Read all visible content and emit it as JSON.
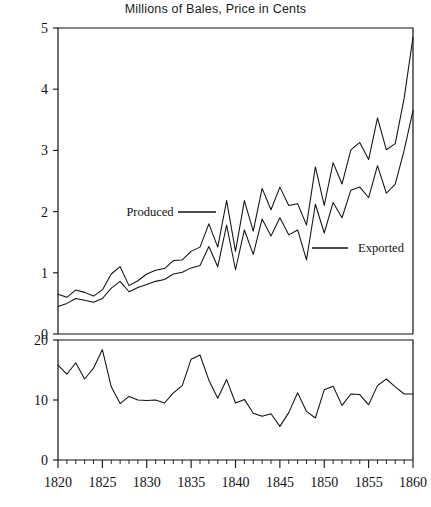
{
  "chart_data": {
    "type": "line",
    "title": "Millions of Bales, Price in Cents",
    "xlabel": "",
    "ylabel": "",
    "grid": false,
    "legend_position": "inline-annotation",
    "panels": [
      {
        "name": "upper",
        "ylabel": "Millions of Bales",
        "ylim": [
          0,
          5
        ],
        "yticks": [
          0,
          1,
          2,
          3,
          4,
          5
        ],
        "xlim": [
          1820,
          1860
        ],
        "series": [
          {
            "name": "Produced",
            "annotation": "Produced",
            "x": [
              1820,
              1821,
              1822,
              1823,
              1824,
              1825,
              1826,
              1827,
              1828,
              1829,
              1830,
              1831,
              1832,
              1833,
              1834,
              1835,
              1836,
              1837,
              1838,
              1839,
              1840,
              1841,
              1842,
              1843,
              1844,
              1845,
              1846,
              1847,
              1848,
              1849,
              1850,
              1851,
              1852,
              1853,
              1854,
              1855,
              1856,
              1857,
              1858,
              1859,
              1860
            ],
            "values": [
              0.65,
              0.6,
              0.72,
              0.68,
              0.62,
              0.72,
              0.98,
              1.1,
              0.79,
              0.87,
              0.98,
              1.04,
              1.07,
              1.2,
              1.21,
              1.35,
              1.42,
              1.8,
              1.42,
              2.18,
              1.35,
              2.18,
              1.68,
              2.38,
              2.03,
              2.4,
              2.1,
              2.13,
              1.78,
              2.73,
              2.1,
              2.8,
              2.45,
              3.01,
              3.13,
              2.85,
              3.53,
              3.01,
              3.11,
              3.85,
              4.85
            ],
            "units": "millions of bales"
          },
          {
            "name": "Exported",
            "annotation": "Exported",
            "x": [
              1820,
              1821,
              1822,
              1823,
              1824,
              1825,
              1826,
              1827,
              1828,
              1829,
              1830,
              1831,
              1832,
              1833,
              1834,
              1835,
              1836,
              1837,
              1838,
              1839,
              1840,
              1841,
              1842,
              1843,
              1844,
              1845,
              1846,
              1847,
              1848,
              1849,
              1850,
              1851,
              1852,
              1853,
              1854,
              1855,
              1856,
              1857,
              1858,
              1859,
              1860
            ],
            "values": [
              0.45,
              0.5,
              0.58,
              0.55,
              0.52,
              0.58,
              0.75,
              0.86,
              0.69,
              0.76,
              0.81,
              0.86,
              0.89,
              0.98,
              1.01,
              1.08,
              1.12,
              1.43,
              1.1,
              1.78,
              1.05,
              1.7,
              1.3,
              1.88,
              1.6,
              1.9,
              1.62,
              1.7,
              1.21,
              2.12,
              1.65,
              2.15,
              1.9,
              2.35,
              2.4,
              2.23,
              2.75,
              2.3,
              2.45,
              3.0,
              3.65
            ],
            "units": "millions of bales"
          }
        ]
      },
      {
        "name": "lower",
        "ylabel": "Price in Cents",
        "ylim": [
          0,
          20
        ],
        "yticks": [
          0,
          10,
          20
        ],
        "xlim": [
          1820,
          1860
        ],
        "series": [
          {
            "name": "Price",
            "x": [
              1820,
              1821,
              1822,
              1823,
              1824,
              1825,
              1826,
              1827,
              1828,
              1829,
              1830,
              1831,
              1832,
              1833,
              1834,
              1835,
              1836,
              1837,
              1838,
              1839,
              1840,
              1841,
              1842,
              1843,
              1844,
              1845,
              1846,
              1847,
              1848,
              1849,
              1850,
              1851,
              1852,
              1853,
              1854,
              1855,
              1856,
              1857,
              1858,
              1859,
              1860
            ],
            "values": [
              15.8,
              14.3,
              16.2,
              13.5,
              15.3,
              18.4,
              12.2,
              9.4,
              10.6,
              10.0,
              9.9,
              10.0,
              9.5,
              11.2,
              12.4,
              16.8,
              17.5,
              13.3,
              10.3,
              13.4,
              9.5,
              10.1,
              7.8,
              7.3,
              7.7,
              5.6,
              7.9,
              11.2,
              8.1,
              7.0,
              11.7,
              12.3,
              9.1,
              11.0,
              10.9,
              9.2,
              12.4,
              13.5,
              12.2,
              11.0,
              11.0
            ],
            "units": "cents per pound"
          }
        ]
      }
    ],
    "xticks_major": [
      1820,
      1825,
      1830,
      1835,
      1840,
      1845,
      1850,
      1855,
      1860
    ],
    "xticks_major_labels": [
      "1820",
      "1825",
      "1830",
      "1835",
      "1840",
      "1845",
      "1850",
      "1855",
      "1860"
    ],
    "xticks_minor_step": 1
  },
  "labels": {
    "upper_yticks": [
      "5",
      "4",
      "3",
      "2",
      "1",
      "0"
    ],
    "lower_yticks": [
      "20",
      "10",
      "0"
    ],
    "produced": "Produced",
    "exported": "Exported"
  }
}
